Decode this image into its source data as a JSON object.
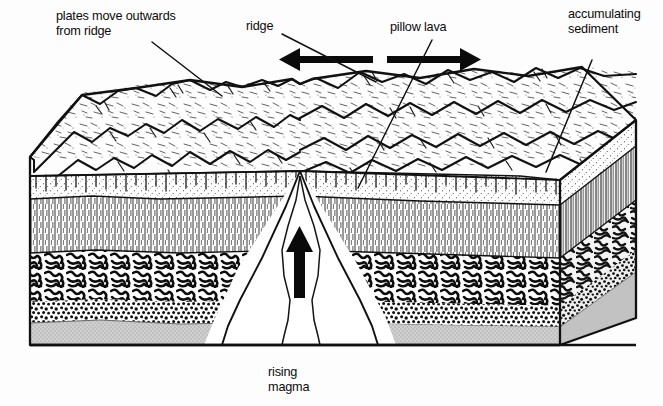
{
  "diagram": {
    "type": "geological-block-diagram",
    "labels": {
      "plates_move": "plates move outwards\nfrom ridge",
      "ridge": "ridge",
      "pillow_lava": "pillow lava",
      "accumulating_sediment": "accumulating\nsediment",
      "rising_magma": "rising\nmagma"
    },
    "arrows": {
      "left_spreading": "left-spreading-arrow",
      "right_spreading": "right-spreading-arrow",
      "magma_up": "rising-magma-arrow"
    },
    "layers": [
      {
        "name": "seafloor-topography",
        "pattern": "mountain-hachure"
      },
      {
        "name": "accumulating-sediment",
        "pattern": "stipple"
      },
      {
        "name": "sheeted-dikes",
        "pattern": "vertical-hatch"
      },
      {
        "name": "pillow-lava",
        "pattern": "squiggle-blobs"
      },
      {
        "name": "coarse-breccia",
        "pattern": "coarse-grain"
      },
      {
        "name": "gabbro-base",
        "pattern": "fine-stipple-gray"
      }
    ],
    "colors": {
      "ink": "#111111",
      "paper": "#fdfdfd",
      "gabbro_gray": "#b9b9b9",
      "shade_gray": "#d8d8d8"
    }
  }
}
